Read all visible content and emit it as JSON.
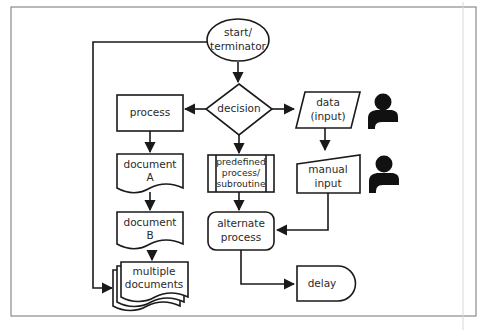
{
  "diagram": {
    "type": "flowchart-symbol-reference",
    "colors": {
      "stroke": "#1a1a1a",
      "text": "#2a2a2a",
      "frame": "#8a8a8a",
      "icon": "#111111"
    },
    "nodes": {
      "start": {
        "shape": "ellipse",
        "line1": "start/",
        "line2": "terminator"
      },
      "decision": {
        "shape": "diamond",
        "label": "decision"
      },
      "process": {
        "shape": "rectangle",
        "label": "process"
      },
      "document_a": {
        "shape": "document",
        "line1": "document",
        "line2": "A"
      },
      "document_b": {
        "shape": "document",
        "line1": "document",
        "line2": "B"
      },
      "multiple_documents": {
        "shape": "multi-document",
        "line1": "multiple",
        "line2": "documents"
      },
      "predefined_process": {
        "shape": "predefined-process",
        "line1": "predefined",
        "line2": "process/",
        "line3": "subroutine"
      },
      "alternate_process": {
        "shape": "rounded-rectangle",
        "line1": "alternate",
        "line2": "process"
      },
      "data_input": {
        "shape": "parallelogram",
        "line1": "data",
        "line2": "(input)"
      },
      "manual_input": {
        "shape": "manual-input",
        "line1": "manual",
        "line2": "input"
      },
      "delay": {
        "shape": "delay",
        "label": "delay"
      }
    },
    "icons": [
      {
        "name": "user-icon",
        "attached_to": "data_input"
      },
      {
        "name": "user-icon",
        "attached_to": "manual_input"
      }
    ],
    "edges": [
      {
        "from": "start",
        "to": "decision"
      },
      {
        "from": "start",
        "to": "multiple_documents",
        "route": "left loop"
      },
      {
        "from": "decision",
        "to": "process"
      },
      {
        "from": "decision",
        "to": "data_input"
      },
      {
        "from": "decision",
        "to": "predefined_process"
      },
      {
        "from": "process",
        "to": "document_a"
      },
      {
        "from": "document_a",
        "to": "document_b"
      },
      {
        "from": "document_b",
        "to": "multiple_documents"
      },
      {
        "from": "data_input",
        "to": "manual_input"
      },
      {
        "from": "predefined_process",
        "to": "alternate_process"
      },
      {
        "from": "manual_input",
        "to": "alternate_process"
      },
      {
        "from": "alternate_process",
        "to": "delay"
      }
    ]
  }
}
